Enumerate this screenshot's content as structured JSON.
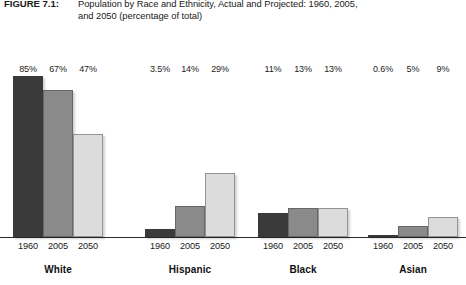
{
  "caption": {
    "label": "FIGURE 7.1:",
    "line1": "Population by Race and Ethnicity, Actual and Projected: 1960, 2005,",
    "line2": "and 2050 (percentage of total)"
  },
  "colors": {
    "year_1960": "#3a3a3a",
    "year_2005": "#8a8a8a",
    "year_2050": "#dcdcdc",
    "axis": "#2b2b2b",
    "text": "#1a1a1a"
  },
  "chart_data": {
    "type": "bar",
    "title": "Population by Race and Ethnicity, Actual and Projected: 1960, 2005, and 2050 (percentage of total)",
    "xlabel": "",
    "ylabel": "",
    "ylim": [
      0,
      100
    ],
    "grid": false,
    "legend": "none",
    "axis_visible": "x-only",
    "categories": [
      "White",
      "Hispanic",
      "Black",
      "Asian"
    ],
    "x": [
      "1960",
      "2005",
      "2050"
    ],
    "series": [
      {
        "name": "1960",
        "values": [
          85,
          3.5,
          11,
          0.6
        ]
      },
      {
        "name": "2005",
        "values": [
          67,
          14,
          13,
          5
        ]
      },
      {
        "name": "2050",
        "values": [
          47,
          29,
          13,
          9
        ]
      }
    ],
    "data_labels": [
      {
        "group": "White",
        "labels": [
          "85%",
          "67%",
          "47%"
        ]
      },
      {
        "group": "Hispanic",
        "labels": [
          "3.5%",
          "14%",
          "29%"
        ]
      },
      {
        "group": "Black",
        "labels": [
          "11%",
          "13%",
          "13%"
        ]
      },
      {
        "group": "Asian",
        "labels": [
          "0.6%",
          "5%",
          "9%"
        ]
      }
    ]
  },
  "groups": [
    {
      "name": "White",
      "left": 13,
      "bar_width": 30,
      "bars": [
        {
          "year": "1960",
          "value": 85,
          "label": "85%",
          "height": 187
        },
        {
          "year": "2005",
          "value": 67,
          "label": "67%",
          "height": 147
        },
        {
          "year": "2050",
          "value": 47,
          "label": "47%",
          "height": 103
        }
      ]
    },
    {
      "name": "Hispanic",
      "left": 145,
      "bar_width": 30,
      "bars": [
        {
          "year": "1960",
          "value": 3.5,
          "label": "3.5%",
          "height": 8
        },
        {
          "year": "2005",
          "value": 14,
          "label": "14%",
          "height": 31
        },
        {
          "year": "2050",
          "value": 29,
          "label": "29%",
          "height": 64
        }
      ]
    },
    {
      "name": "Black",
      "left": 258,
      "bar_width": 30,
      "bars": [
        {
          "year": "1960",
          "value": 11,
          "label": "11%",
          "height": 24
        },
        {
          "year": "2005",
          "value": 13,
          "label": "13%",
          "height": 29
        },
        {
          "year": "2050",
          "value": 13,
          "label": "13%",
          "height": 29
        }
      ]
    },
    {
      "name": "Asian",
      "left": 368,
      "bar_width": 30,
      "bars": [
        {
          "year": "1960",
          "value": 0.6,
          "label": "0.6%",
          "height": 2
        },
        {
          "year": "2005",
          "value": 5,
          "label": "5%",
          "height": 11
        },
        {
          "year": "2050",
          "value": 9,
          "label": "9%",
          "height": 20
        }
      ]
    }
  ]
}
